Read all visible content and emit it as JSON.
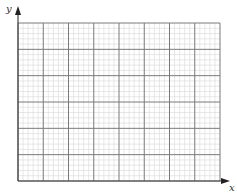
{
  "diagram": {
    "type": "graph-paper-axes",
    "axes": {
      "x_label": "x",
      "y_label": "y",
      "origin_px": [
        18,
        181
      ]
    },
    "grid": {
      "left": 18,
      "top": 23,
      "right": 220,
      "bottom": 181,
      "major_columns": 8,
      "major_rows": 6,
      "minor_per_major": 5,
      "major_color": "#7a7a7a",
      "minor_color": "#d6d6d6",
      "axis_color": "#444444"
    },
    "y_axis_top": 6,
    "x_axis_right": 230
  }
}
